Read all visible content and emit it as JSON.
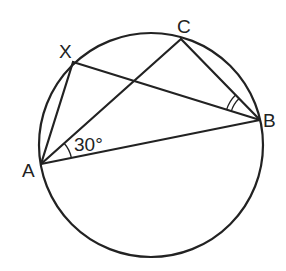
{
  "diagram": {
    "title": "",
    "points": [
      {
        "id": "A",
        "label": "A"
      },
      {
        "id": "B",
        "label": "B"
      },
      {
        "id": "C",
        "label": "C"
      },
      {
        "id": "X",
        "label": "X"
      }
    ],
    "segments": [
      [
        "A",
        "B"
      ],
      [
        "A",
        "C"
      ],
      [
        "A",
        "X"
      ],
      [
        "X",
        "B"
      ],
      [
        "C",
        "B"
      ]
    ],
    "angle_labels": [
      {
        "vertex": "A",
        "between": [
          "B",
          "C"
        ],
        "text": "30°"
      },
      {
        "vertex": "B",
        "between": [
          "X",
          "C"
        ],
        "text": "",
        "marker": "double-arc"
      }
    ],
    "colors": {
      "ink": "#222222",
      "background": "#ffffff"
    }
  }
}
